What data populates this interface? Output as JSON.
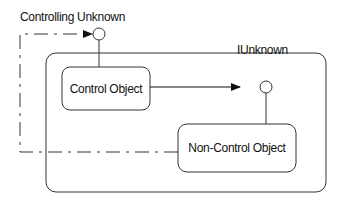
{
  "diagram": {
    "labels": {
      "controlling_unknown": "Controlling Unknown",
      "iunknown": "IUnknown"
    },
    "nodes": {
      "control_object": "Control Object",
      "non_control_object": "Non-Control Object"
    },
    "edges": [
      {
        "from": "Control Object",
        "to": "IUnknown",
        "style": "solid-arrow"
      },
      {
        "from": "Non-Control Object",
        "to": "Controlling Unknown",
        "style": "dash-dot-arrow"
      }
    ],
    "colors": {
      "stroke": "#222222",
      "background": "#ffffff"
    }
  }
}
